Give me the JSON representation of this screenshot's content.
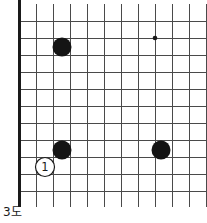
{
  "figure": {
    "caption": "3도",
    "type": "go-board-diagram",
    "background_color": "#ffffff"
  },
  "board": {
    "name": "go-board",
    "orientation": "bottom-left-corner",
    "grid": {
      "origin_x": 19,
      "origin_y": 21,
      "spacing": 17,
      "columns": 11,
      "rows": 11,
      "line_color": "#4a4a4a",
      "line_width": 1,
      "edge_color": "#1a1a1a",
      "edge_width": 3,
      "thick_edges": [
        "left",
        "bottom"
      ]
    },
    "star_points": [
      {
        "name": "star-point-right",
        "col": 8,
        "row": 1,
        "x": 155,
        "y": 38,
        "radius": 2.3,
        "color": "#1a1a1a"
      }
    ],
    "stones": [
      {
        "name": "black-stone-upper-left",
        "color": "black",
        "fill": "#141414",
        "col": 2,
        "row": 1,
        "x": 62,
        "y": 47,
        "radius": 9.5,
        "label": ""
      },
      {
        "name": "black-stone-lower-left",
        "color": "black",
        "fill": "#141414",
        "col": 2,
        "row": 7,
        "x": 62,
        "y": 150,
        "radius": 9.5,
        "label": ""
      },
      {
        "name": "black-stone-lower-right",
        "color": "black",
        "fill": "#141414",
        "col": 8,
        "row": 7,
        "x": 161,
        "y": 150,
        "radius": 9.5,
        "label": ""
      },
      {
        "name": "white-stone-move-1",
        "color": "white",
        "fill": "#ffffff",
        "col": 1,
        "row": 8,
        "x": 45,
        "y": 167,
        "radius": 9.5,
        "label": "1",
        "label_color": "#1a1a1a",
        "outline": "#1a1a1a"
      }
    ]
  },
  "move_list": [
    {
      "number": "1",
      "color": "white",
      "x": 45,
      "y": 167
    }
  ]
}
